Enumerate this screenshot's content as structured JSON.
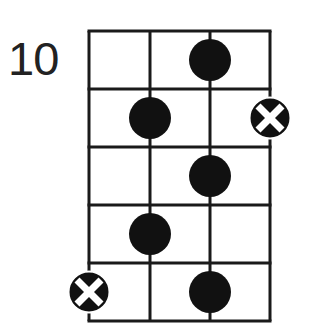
{
  "diagram": {
    "type": "fretboard-scale-diagram",
    "fret_label": "10",
    "strings": 4,
    "frets": 5,
    "colors": {
      "line": "#1a1a1a",
      "dot": "#111111",
      "x_mark": "#ffffff",
      "background": "#ffffff",
      "label": "#222222"
    },
    "grid": {
      "x": [
        89,
        150,
        210,
        270
      ],
      "y": [
        31,
        89,
        147,
        205,
        263,
        321
      ]
    },
    "markers": [
      {
        "kind": "dot",
        "string": 3,
        "fret": 1
      },
      {
        "kind": "dot",
        "string": 2,
        "fret": 2
      },
      {
        "kind": "root",
        "string": 4,
        "fret": 2
      },
      {
        "kind": "dot",
        "string": 3,
        "fret": 3
      },
      {
        "kind": "dot",
        "string": 2,
        "fret": 4
      },
      {
        "kind": "root",
        "string": 1,
        "fret": 5
      },
      {
        "kind": "dot",
        "string": 3,
        "fret": 5
      }
    ]
  }
}
